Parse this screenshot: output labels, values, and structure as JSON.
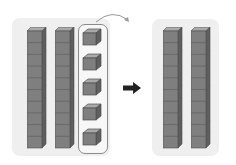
{
  "diagram": {
    "left_group": {
      "tens_rods": 2,
      "cubes_per_rod": 10,
      "ones_cubes": 5,
      "ones_highlighted": true
    },
    "right_group": {
      "tens_rods": 2,
      "cubes_per_rod": 10,
      "ones_cubes": 0
    },
    "arrows": [
      {
        "type": "curved-arrow",
        "from": "ones-group",
        "direction": "right"
      },
      {
        "type": "block-arrow",
        "direction": "right"
      }
    ],
    "colors": {
      "panel": "#efefef",
      "cube_front": "#7f7f7f",
      "cube_top": "#a9a9a9",
      "cube_side": "#5f5f5f",
      "cube_edge": "#4f4f4f",
      "group_outline": "#8a8a8a",
      "arrow": "#222222",
      "curve_arrow": "#9a9a9a"
    }
  }
}
